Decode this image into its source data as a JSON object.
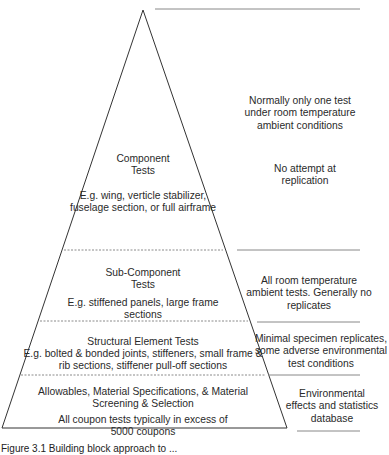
{
  "diagram": {
    "type": "building-block pyramid",
    "levels": [
      {
        "title": "Component\nTests",
        "example": "E.g. wing, verticle stabilizer,\nfuselage section, or full airframe"
      },
      {
        "title": "Sub-Component\nTests",
        "example": "E.g. stiffened panels, large frame\nsections"
      },
      {
        "title": "Structural Element Tests",
        "example": "E.g. bolted & bonded joints, stiffeners, small frame &\nrib sections, stiffener pull-off sections"
      },
      {
        "title": "Allowables, Material Specifications, & Material\nScreening & Selection",
        "example": "All coupon tests typically in excess of\n5000 coupons"
      }
    ],
    "annotations": [
      "Normally only one test\nunder room temperature\nambient conditions",
      "No attempt at\nreplication",
      "All room temperature\nambient tests. Generally no\nreplicates",
      "Minimal specimen replicates,\nsome adverse environmental\ntest conditions",
      "Environmental\neffects and statistics\ndatabase"
    ],
    "caption": "Figure 3.1 Building block approach to ..."
  },
  "colors": {
    "outline": "#333333",
    "dashed": "#8a8a8a",
    "separator": "#888888"
  }
}
